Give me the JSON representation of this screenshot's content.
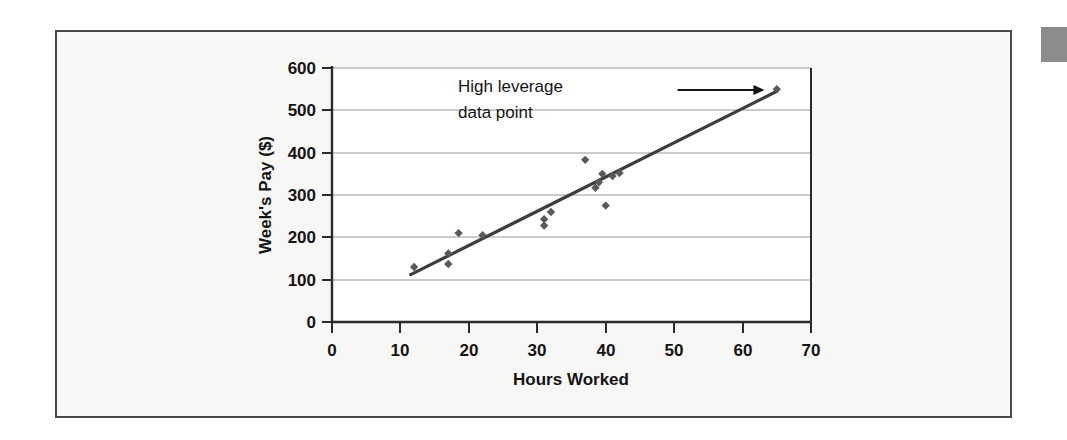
{
  "figure": {
    "background_color": "#f7f7f5",
    "border_color": "#4a4a4a",
    "marker_color": "#595959",
    "line_color": "#3d3d3d",
    "grid_color": "#9a9a9a",
    "corner_marker_color": "#8b8b8b",
    "corner_marker_name": "gray-swatch"
  },
  "chart_data": {
    "type": "scatter",
    "title": "",
    "xlabel": "Hours Worked",
    "ylabel": "Week's Pay ($)",
    "xlim": [
      0,
      70
    ],
    "ylim": [
      0,
      600
    ],
    "xticks": [
      0,
      10,
      20,
      30,
      40,
      50,
      60,
      70
    ],
    "yticks": [
      0,
      100,
      200,
      300,
      400,
      500,
      600
    ],
    "xticklabels": [
      "0",
      "10",
      "20",
      "30",
      "40",
      "50",
      "60",
      "70"
    ],
    "yticklabels": [
      "0",
      "100",
      "200",
      "300",
      "400",
      "500",
      "600"
    ],
    "grid": "horizontal",
    "legend": "none",
    "points": [
      {
        "x": 12,
        "y": 130
      },
      {
        "x": 17,
        "y": 137
      },
      {
        "x": 17,
        "y": 162
      },
      {
        "x": 18.5,
        "y": 210
      },
      {
        "x": 22,
        "y": 205
      },
      {
        "x": 31,
        "y": 228
      },
      {
        "x": 31,
        "y": 243
      },
      {
        "x": 32,
        "y": 260
      },
      {
        "x": 37,
        "y": 383
      },
      {
        "x": 38.5,
        "y": 317
      },
      {
        "x": 39,
        "y": 330
      },
      {
        "x": 39.5,
        "y": 350
      },
      {
        "x": 40,
        "y": 275
      },
      {
        "x": 41,
        "y": 345
      },
      {
        "x": 42,
        "y": 352
      },
      {
        "x": 65,
        "y": 550
      }
    ],
    "trendline": {
      "name": "regression-line",
      "x_start": 11.5,
      "y_start": 112,
      "x_end": 65,
      "y_end": 545
    },
    "annotations": [
      {
        "name": "high-leverage-annotation",
        "line1": "High leverage",
        "line2": "data point",
        "arrow_from_x": 50.5,
        "arrow_from_y": 548,
        "arrow_to_x": 63.2,
        "arrow_to_y": 548
      }
    ]
  }
}
